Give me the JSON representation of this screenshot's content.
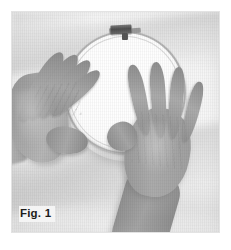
{
  "figure": {
    "caption": "Fig. 1",
    "scene_description": "Two hands holding a circular embroidery hoop over white fabric",
    "color_mode": "grayscale",
    "objects": {
      "hoop": {
        "name": "embroidery-hoop",
        "shape": "circle",
        "hardware": "tension screw at top",
        "ring_color": "#b3b3b3",
        "fabric_color": "#fdfdfd"
      },
      "left_hand": {
        "name": "left-hand",
        "pose": "fingers together, thumb extended along hoop edge",
        "skin_tone": "#a5a5a5"
      },
      "right_hand": {
        "name": "right-hand",
        "pose": "fingers spread, palm flat on fabric",
        "skin_tone": "#ababab"
      },
      "cloth": {
        "name": "white-fabric",
        "color": "#f6f6f6"
      }
    },
    "frame": {
      "border_color": "#e3e3e3",
      "background_color": "#f7f7f7"
    }
  },
  "page": {
    "background_color": "#ffffff"
  }
}
